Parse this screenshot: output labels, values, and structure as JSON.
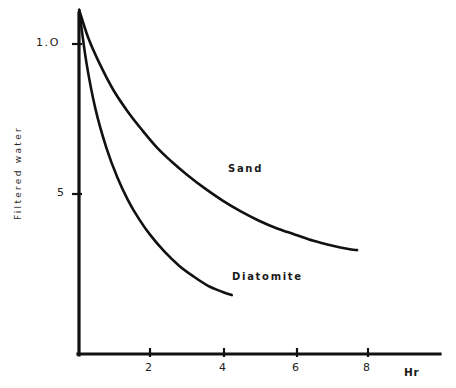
{
  "chart_data": {
    "type": "line",
    "title": "",
    "subtitle": "",
    "xlabel": "Hr",
    "ylabel": "Filtered water",
    "xlim": [
      0,
      9.8
    ],
    "ylim": [
      0,
      1.14
    ],
    "grid": false,
    "legend_position": "inline-annotations",
    "xticks": [
      "2",
      "4",
      "6",
      "8"
    ],
    "xtick_values": [
      2,
      4,
      6,
      8
    ],
    "yticks": [
      "1.O",
      "5"
    ],
    "ytick_values": [
      1.0,
      0.5
    ],
    "annotations": [
      {
        "text": "Sand",
        "x": 4.1,
        "y": 0.62
      },
      {
        "text": "Diatomite",
        "x": 4.25,
        "y": 0.27
      }
    ],
    "series": [
      {
        "name": "Sand",
        "x": [
          0.05,
          0.3,
          0.6,
          1.0,
          1.4,
          1.8,
          2.2,
          2.6,
          3.0,
          3.5,
          4.0,
          4.5,
          5.0,
          5.5,
          6.0,
          6.5,
          7.0,
          7.5,
          7.7
        ],
        "y": [
          1.11,
          1.02,
          0.94,
          0.85,
          0.78,
          0.72,
          0.665,
          0.62,
          0.58,
          0.535,
          0.495,
          0.46,
          0.43,
          0.405,
          0.385,
          0.365,
          0.35,
          0.338,
          0.335
        ]
      },
      {
        "name": "Diatomite",
        "x": [
          0.05,
          0.25,
          0.5,
          0.8,
          1.1,
          1.4,
          1.7,
          2.0,
          2.4,
          2.8,
          3.2,
          3.6,
          4.0,
          4.25
        ],
        "y": [
          1.11,
          0.94,
          0.79,
          0.665,
          0.57,
          0.495,
          0.435,
          0.385,
          0.33,
          0.285,
          0.25,
          0.22,
          0.2,
          0.19
        ]
      }
    ]
  },
  "axes": {
    "y_axis_title": "Filtered water",
    "x_axis_title": "Hr"
  }
}
